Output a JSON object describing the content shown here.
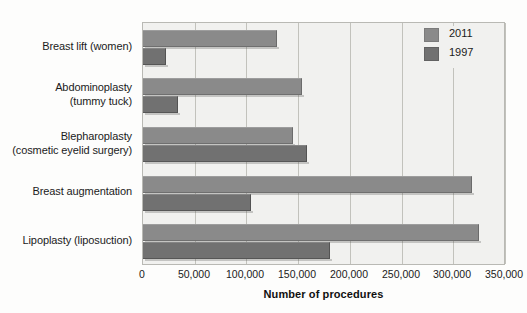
{
  "chart_data": {
    "type": "bar",
    "orientation": "horizontal",
    "title": "",
    "xlabel": "Number of procedures",
    "ylabel": "",
    "xlim": [
      0,
      350000
    ],
    "xticks": [
      0,
      50000,
      100000,
      150000,
      200000,
      250000,
      300000,
      350000
    ],
    "xtick_labels": [
      "0",
      "50,000",
      "100,000",
      "150,000",
      "200,000",
      "250,000",
      "300,000",
      "350,000"
    ],
    "grid": "vertical",
    "legend_position": "top-right",
    "categories": [
      "Breast lift (women)",
      "Abdominoplasty (tummy tuck)",
      "Blepharoplasty (cosmetic eyelid surgery)",
      "Breast augmentation",
      "Lipoplasty (liposuction)"
    ],
    "category_lines": [
      [
        "Breast lift (women)"
      ],
      [
        "Abdominoplasty",
        "(tummy tuck)"
      ],
      [
        "Blepharoplasty",
        "(cosmetic eyelid surgery)"
      ],
      [
        "Breast augmentation"
      ],
      [
        "Lipoplasty (liposuction)"
      ]
    ],
    "series": [
      {
        "name": "2011",
        "color": "#8a8a8a",
        "values": [
          130000,
          154000,
          145000,
          318000,
          325000
        ]
      },
      {
        "name": "1997",
        "color": "#717171",
        "values": [
          22000,
          34000,
          159000,
          104000,
          181000
        ]
      }
    ]
  },
  "legend": {
    "entries": [
      {
        "label": "2011",
        "swatch": "legend-swatch-2011"
      },
      {
        "label": "1997",
        "swatch": "legend-swatch-1997"
      }
    ]
  },
  "axis": {
    "x_title": "Number of procedures"
  }
}
